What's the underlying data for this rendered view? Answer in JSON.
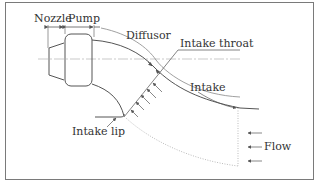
{
  "diagram": {
    "type": "waterjet-intake-schematic",
    "labels": {
      "nozzle": "Nozzle",
      "pump": "Pump",
      "diffusor": "Diffusor",
      "intake_throat": "Intake throat",
      "intake": "Intake",
      "intake_lip": "Intake lip",
      "flow": "Flow"
    },
    "colors": {
      "line": "#555555",
      "dotted": "#aaaaaa",
      "centerline": "#bbbbbb",
      "frame": "#7a7a7a",
      "text": "#333333"
    }
  }
}
